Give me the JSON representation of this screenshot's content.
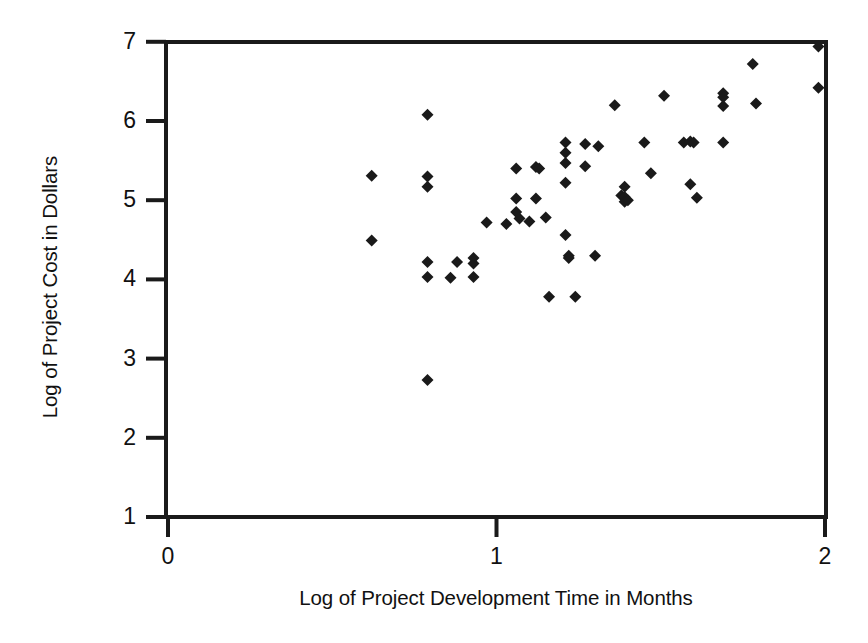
{
  "chart_data": {
    "type": "scatter",
    "title": "",
    "xlabel": "Log of Project Development Time in Months",
    "ylabel": "Log of Project Cost in Dollars",
    "xlim": [
      0,
      2
    ],
    "ylim": [
      1,
      7
    ],
    "xticks": [
      "0",
      "1",
      "2"
    ],
    "xtick_values": [
      0,
      1,
      2
    ],
    "yticks": [
      "1",
      "2",
      "3",
      "4",
      "5",
      "6",
      "7"
    ],
    "ytick_values": [
      1,
      2,
      3,
      4,
      5,
      6,
      7
    ],
    "grid": false,
    "legend": null,
    "marker": "diamond",
    "marker_color": "#1a1a1a",
    "marker_size": 11,
    "n_points": 59,
    "points": [
      [
        0.62,
        5.31
      ],
      [
        0.62,
        4.49
      ],
      [
        0.79,
        6.08
      ],
      [
        0.79,
        5.3
      ],
      [
        0.79,
        5.17
      ],
      [
        0.79,
        4.22
      ],
      [
        0.79,
        4.03
      ],
      [
        0.79,
        2.73
      ],
      [
        0.86,
        4.02
      ],
      [
        0.88,
        4.22
      ],
      [
        0.93,
        4.27
      ],
      [
        0.93,
        4.2
      ],
      [
        0.93,
        4.03
      ],
      [
        0.97,
        4.72
      ],
      [
        1.03,
        4.7
      ],
      [
        1.06,
        5.4
      ],
      [
        1.06,
        5.02
      ],
      [
        1.06,
        4.85
      ],
      [
        1.07,
        4.77
      ],
      [
        1.1,
        4.73
      ],
      [
        1.12,
        5.42
      ],
      [
        1.13,
        5.4
      ],
      [
        1.15,
        4.78
      ],
      [
        1.16,
        3.78
      ],
      [
        1.21,
        5.73
      ],
      [
        1.21,
        5.6
      ],
      [
        1.21,
        5.47
      ],
      [
        1.21,
        5.22
      ],
      [
        1.21,
        4.56
      ],
      [
        1.22,
        4.3
      ],
      [
        1.22,
        4.27
      ],
      [
        1.24,
        3.78
      ],
      [
        1.27,
        5.71
      ],
      [
        1.27,
        5.43
      ],
      [
        1.3,
        4.3
      ],
      [
        1.31,
        5.68
      ],
      [
        1.36,
        6.2
      ],
      [
        1.38,
        5.06
      ],
      [
        1.39,
        5.17
      ],
      [
        1.39,
        5.04
      ],
      [
        1.39,
        4.98
      ],
      [
        1.4,
        5.0
      ],
      [
        1.45,
        5.73
      ],
      [
        1.47,
        5.34
      ],
      [
        1.51,
        6.32
      ],
      [
        1.57,
        5.73
      ],
      [
        1.59,
        5.74
      ],
      [
        1.59,
        5.2
      ],
      [
        1.6,
        5.73
      ],
      [
        1.61,
        5.03
      ],
      [
        1.69,
        5.73
      ],
      [
        1.69,
        6.35
      ],
      [
        1.69,
        6.19
      ],
      [
        1.69,
        6.3
      ],
      [
        1.78,
        6.72
      ],
      [
        1.79,
        6.22
      ],
      [
        1.98,
        6.94
      ],
      [
        1.98,
        6.42
      ],
      [
        1.12,
        5.02
      ]
    ]
  },
  "axes": {
    "y_tick_labels": [
      "7",
      "6",
      "5",
      "4",
      "3",
      "2",
      "1"
    ],
    "x_tick_labels": [
      "0",
      "1",
      "2"
    ],
    "y_axis_title": "Log of Project Cost in Dollars",
    "x_axis_title": "Log of Project Development Time in Months"
  }
}
